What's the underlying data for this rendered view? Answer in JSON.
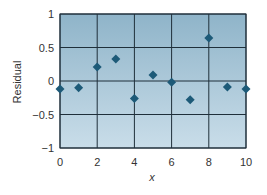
{
  "chart_data": {
    "type": "scatter",
    "title": "",
    "xlabel": "x",
    "ylabel": "Residual",
    "xlim": [
      0,
      10
    ],
    "ylim": [
      -1,
      1
    ],
    "xticks": [
      0,
      2,
      4,
      6,
      8,
      10
    ],
    "yticks": [
      1,
      0.5,
      0,
      -0.5,
      -1
    ],
    "ytick_labels": [
      "1",
      "0.5",
      "0",
      "−0.5",
      "−1"
    ],
    "grid": true,
    "legend": null,
    "marker": "diamond",
    "series": [
      {
        "name": "Residual",
        "x": [
          0,
          1,
          2,
          3,
          4,
          5,
          6,
          7,
          8,
          9,
          10
        ],
        "y": [
          -0.12,
          -0.1,
          0.21,
          0.33,
          -0.26,
          0.09,
          -0.02,
          -0.28,
          0.64,
          -0.09,
          -0.12
        ]
      }
    ]
  },
  "colors": {
    "plot_bg_top": "#8fb4c9",
    "plot_bg_bottom": "#c9dde9",
    "grid": "#1f2f3a",
    "marker": "#1d5a78",
    "text": "#333333"
  }
}
